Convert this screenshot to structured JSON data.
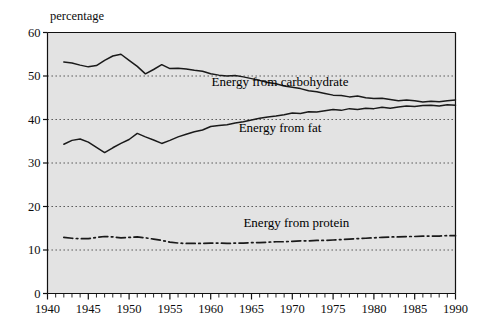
{
  "chart_data": {
    "type": "line",
    "title": "",
    "ylabel": "percentage",
    "xlabel": "",
    "xlim": [
      1940,
      1990
    ],
    "ylim": [
      0,
      60
    ],
    "ytick_values": [
      0,
      10,
      20,
      30,
      40,
      50,
      60
    ],
    "ytick_labels": [
      "0",
      "10",
      "20",
      "30",
      "40",
      "50",
      "60"
    ],
    "xtick_values": [
      1940,
      1945,
      1950,
      1955,
      1960,
      1965,
      1970,
      1975,
      1980,
      1985,
      1990
    ],
    "xtick_labels": [
      "1940",
      "1945",
      "1950",
      "1955",
      "1960",
      "1965",
      "1970",
      "1975",
      "1980",
      "1985",
      "1990"
    ],
    "minor_xtick_step": 1,
    "grid": "horizontal-dotted",
    "grid_values": [
      10,
      20,
      30,
      40,
      50
    ],
    "legend_position": "inline-annotations",
    "plot_background": "#e3e3e3",
    "line_color": "#1a1a1a",
    "series": [
      {
        "name": "Energy from carbohydrate",
        "label": "Energy from carbohydrate",
        "style": "solid",
        "label_x": 1968.5,
        "label_y": 47.6,
        "x": [
          1942,
          1943,
          1944,
          1945,
          1946,
          1947,
          1948,
          1949,
          1950,
          1951,
          1952,
          1953,
          1954,
          1955,
          1956,
          1957,
          1958,
          1959,
          1960,
          1961,
          1962,
          1963,
          1964,
          1965,
          1966,
          1967,
          1968,
          1969,
          1970,
          1971,
          1972,
          1973,
          1974,
          1975,
          1976,
          1977,
          1978,
          1979,
          1980,
          1981,
          1982,
          1983,
          1984,
          1985,
          1986,
          1987,
          1988,
          1989,
          1990
        ],
        "values": [
          53.2,
          53.0,
          52.5,
          52.1,
          52.4,
          53.6,
          54.6,
          55.0,
          53.6,
          52.2,
          50.5,
          51.5,
          52.6,
          51.7,
          51.8,
          51.6,
          51.3,
          51.1,
          50.5,
          50.2,
          50.0,
          50.1,
          49.8,
          49.4,
          49.0,
          48.5,
          48.2,
          47.7,
          47.4,
          47.1,
          46.6,
          46.4,
          46.0,
          45.6,
          45.5,
          45.2,
          45.4,
          45.0,
          44.8,
          44.9,
          44.6,
          44.3,
          44.5,
          44.3,
          44.0,
          44.2,
          44.1,
          44.3,
          44.5
        ]
      },
      {
        "name": "Energy from fat",
        "label": "Energy from fat",
        "style": "solid",
        "label_x": 1968.5,
        "label_y": 37.2,
        "x": [
          1942,
          1943,
          1944,
          1945,
          1946,
          1947,
          1948,
          1949,
          1950,
          1951,
          1952,
          1953,
          1954,
          1955,
          1956,
          1957,
          1958,
          1959,
          1960,
          1961,
          1962,
          1963,
          1964,
          1965,
          1966,
          1967,
          1968,
          1969,
          1970,
          1971,
          1972,
          1973,
          1974,
          1975,
          1976,
          1977,
          1978,
          1979,
          1980,
          1981,
          1982,
          1983,
          1984,
          1985,
          1986,
          1987,
          1988,
          1989,
          1990
        ],
        "values": [
          34.3,
          35.2,
          35.5,
          34.8,
          33.6,
          32.4,
          33.5,
          34.5,
          35.4,
          36.8,
          36.0,
          35.3,
          34.5,
          35.2,
          36.0,
          36.6,
          37.2,
          37.6,
          38.4,
          38.6,
          38.8,
          39.2,
          39.5,
          39.9,
          40.3,
          40.6,
          40.8,
          41.1,
          41.5,
          41.4,
          41.8,
          41.7,
          42.0,
          42.3,
          42.1,
          42.5,
          42.3,
          42.6,
          42.5,
          42.8,
          42.6,
          42.9,
          43.1,
          43.0,
          43.2,
          43.3,
          43.1,
          43.4,
          43.3
        ]
      },
      {
        "name": "Energy from protein",
        "label": "Energy from protein",
        "style": "dash-dot",
        "label_x": 1970.5,
        "label_y": 15.2,
        "x": [
          1942,
          1943,
          1944,
          1945,
          1946,
          1947,
          1948,
          1949,
          1950,
          1951,
          1952,
          1953,
          1954,
          1955,
          1956,
          1957,
          1958,
          1959,
          1960,
          1961,
          1962,
          1963,
          1964,
          1965,
          1966,
          1967,
          1968,
          1969,
          1970,
          1971,
          1972,
          1973,
          1974,
          1975,
          1976,
          1977,
          1978,
          1979,
          1980,
          1981,
          1982,
          1983,
          1984,
          1985,
          1986,
          1987,
          1988,
          1989,
          1990
        ],
        "values": [
          12.9,
          12.7,
          12.6,
          12.6,
          12.9,
          13.1,
          13.0,
          12.8,
          12.9,
          13.0,
          12.8,
          12.5,
          12.2,
          11.8,
          11.6,
          11.5,
          11.5,
          11.5,
          11.6,
          11.6,
          11.5,
          11.6,
          11.6,
          11.7,
          11.7,
          11.8,
          11.9,
          11.9,
          12.0,
          12.1,
          12.1,
          12.2,
          12.2,
          12.3,
          12.4,
          12.5,
          12.6,
          12.7,
          12.8,
          12.9,
          13.0,
          13.0,
          13.1,
          13.1,
          13.2,
          13.2,
          13.2,
          13.3,
          13.3
        ]
      }
    ]
  }
}
